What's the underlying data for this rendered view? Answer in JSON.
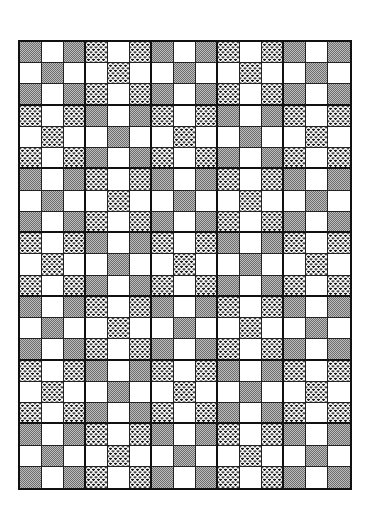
{
  "page": {
    "legend": {
      "G": "gray-dither",
      "D": "dotted",
      "W": "white"
    },
    "colors": {
      "border": "#111111",
      "gray": "#9a9a9a",
      "dot": "#1a1a1a",
      "white": "#ffffff"
    },
    "columns": 15,
    "rows": 21,
    "block_size": 3,
    "grid": [
      "GWGDWDGWGDWDGWG",
      "WGWWDWWGWWDWWGW",
      "GWGDWDGWGDWDGWG",
      "DWDGWGDWDGWGDWD",
      "WDWWGWWDWWGWWDW",
      "DWDGWGDWDGWGDWD",
      "GWGDWDGWGDWDGWG",
      "WGWWDWWGWWDWWGW",
      "GWGDWDGWGDWDGWG",
      "DWDGWGDWDGWGDWD",
      "WDWWGWWDWWGWWDW",
      "DWDGWGDWDGWGDWD",
      "GWGDWDGWGDWDGWG",
      "WGWWDWWGWWDWWGW",
      "GWGDWDGWGDWDGWG",
      "DWDGWGDWDGWGDWD",
      "WDWWGWWDWWGWWDW",
      "DWDGWGDWDGWGDWD",
      "GWGDWDGWGDWDGWG",
      "WGWWDWWGWWDWWGW",
      "GWGDWDGWGDWDGWG"
    ]
  }
}
